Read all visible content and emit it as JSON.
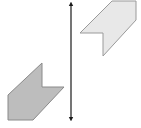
{
  "diagram": {
    "type": "reflection",
    "line_of_reflection": {
      "x": 71,
      "y1": 3,
      "y2": 120,
      "color": "#1a1a1a",
      "arrowheads": "both"
    },
    "shapes": [
      {
        "name": "preimage",
        "fill": "#e8e8e8",
        "stroke": "#9a9a9a",
        "points": "112,1 136,1 136,20 103,56 103,33 80,33"
      },
      {
        "name": "image",
        "fill": "#bdbdbd",
        "stroke": "#8a8a8a",
        "points": "42,63 42,87 64,87 33,120 8,120 8,95"
      }
    ]
  }
}
